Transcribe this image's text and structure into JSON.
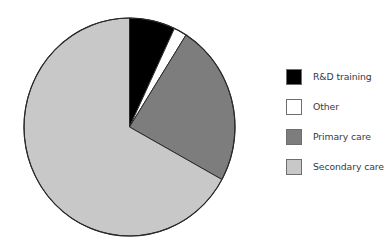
{
  "chart_data": {
    "type": "pie",
    "title": "",
    "categories": [
      "R&D training",
      "Other",
      "Primary care",
      "Secondary care"
    ],
    "values": [
      7,
      2,
      24,
      67
    ],
    "unit": "%",
    "colors": [
      "#000000",
      "#ffffff",
      "#7d7d7d",
      "#c8c8c8"
    ],
    "start_angle_deg": 0,
    "direction": "clockwise",
    "legend_position": "right",
    "grid": false
  },
  "legend": {
    "items": [
      {
        "label": "R&D training",
        "color": "#000000"
      },
      {
        "label": "Other",
        "color": "#ffffff"
      },
      {
        "label": "Primary care",
        "color": "#7d7d7d"
      },
      {
        "label": "Secondary care",
        "color": "#c8c8c8"
      }
    ]
  }
}
